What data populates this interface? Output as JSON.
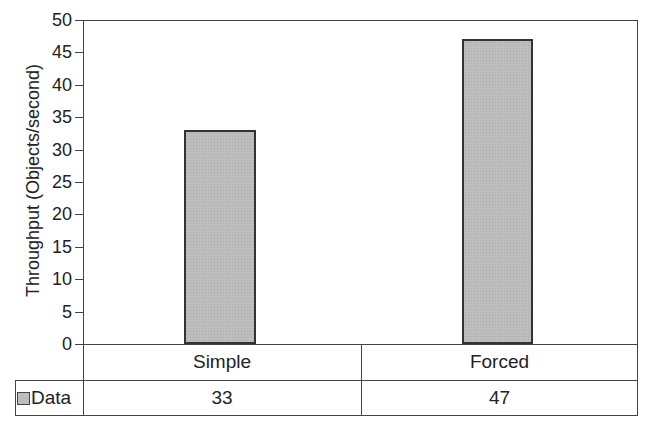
{
  "chart_data": {
    "type": "bar",
    "title": "",
    "xlabel": "",
    "ylabel": "Throughput (Objects/second)",
    "categories": [
      "Simple",
      "Forced"
    ],
    "series": [
      {
        "name": "Data",
        "values": [
          33,
          47
        ]
      }
    ],
    "ylim": [
      0,
      50
    ],
    "yticks": [
      0,
      5,
      10,
      15,
      20,
      25,
      30,
      35,
      40,
      45,
      50
    ],
    "grid": false,
    "legend": {
      "position": "data-table",
      "entries": [
        "Data"
      ]
    },
    "data_table": true,
    "bar_color": "#bdbdbd"
  },
  "labels": {
    "yticks": [
      "0",
      "5",
      "10",
      "15",
      "20",
      "25",
      "30",
      "35",
      "40",
      "45",
      "50"
    ],
    "ytitle": "Throughput (Objects/second)",
    "cat0": "Simple",
    "cat1": "Forced",
    "legend": "Data",
    "val0": "33",
    "val1": "47"
  }
}
